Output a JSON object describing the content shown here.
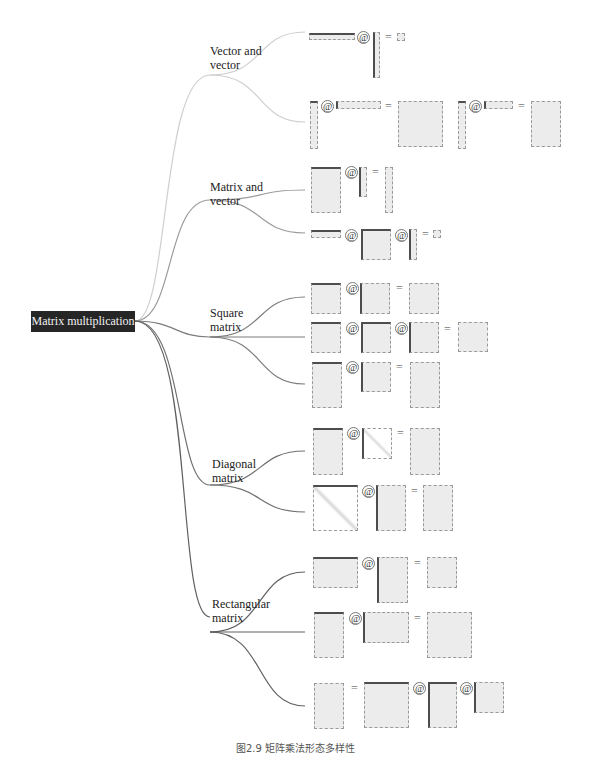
{
  "root": {
    "label": "Matrix multiplication"
  },
  "branches": [
    {
      "id": "vv",
      "label": "Vector and\nvector",
      "link_color": "#c8c8c8"
    },
    {
      "id": "mv",
      "label": "Matrix and\nvector",
      "link_color": "#9a9a9a"
    },
    {
      "id": "sq",
      "label": "Square\nmatrix",
      "link_color": "#7a7a7a"
    },
    {
      "id": "dg",
      "label": "Diagonal\nmatrix",
      "link_color": "#6e6e6e"
    },
    {
      "id": "rc",
      "label": "Rectangular\nmatrix",
      "link_color": "#5e5e5e"
    }
  ],
  "operators": {
    "matmul": "@",
    "equals": "="
  },
  "examples": {
    "vv": [
      "row(1×n) @ col(n×1) = scalar(1×1)",
      "col(m×1) @ row(1×n) = matrix(m×n)",
      "col(m×1) @ row(1×n) = matrix(m×n)"
    ],
    "mv": [
      "matrix(m×n) @ col(n×1) = col(m×1)",
      "row(1×n) @ matrix(n×n) @ col(n×1) = scalar(1×1)"
    ],
    "sq": [
      "A(n×n) @ B(n×n) = C(n×n)",
      "A @ B @ C = D (all n×n)",
      "A(m×n) @ B(n×n) = C(m×n)"
    ],
    "dg": [
      "A(m×n) @ diag(n×n) = C(m×n)",
      "diag(m×m) @ A(m×n) = C(m×n)"
    ],
    "rc": [
      "A(m×n) @ B(n×p) = C(m×p)",
      "A(m×n) @ B(n×p) = C(m×p)",
      "D = A @ B @ C"
    ]
  },
  "caption": "图2.9   矩阵乘法形态多样性"
}
